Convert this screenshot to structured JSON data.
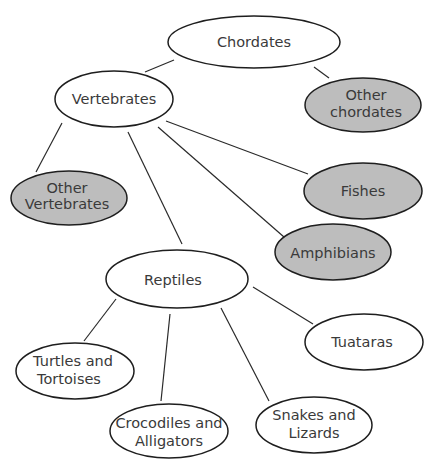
{
  "diagram": {
    "type": "concept-map",
    "colors": {
      "unshaded_fill": "#ffffff",
      "shaded_fill": "#bdbdbd",
      "stroke": "#1e1e1e"
    },
    "nodes": [
      {
        "id": "chordates",
        "lines": [
          "Chordates"
        ],
        "shaded": false
      },
      {
        "id": "vertebrates",
        "lines": [
          "Vertebrates"
        ],
        "shaded": false
      },
      {
        "id": "other_chordates",
        "lines": [
          "Other",
          "chordates"
        ],
        "shaded": true
      },
      {
        "id": "other_vertebrates",
        "lines": [
          "Other",
          "Vertebrates"
        ],
        "shaded": true
      },
      {
        "id": "fishes",
        "lines": [
          "Fishes"
        ],
        "shaded": true
      },
      {
        "id": "amphibians",
        "lines": [
          "Amphibians"
        ],
        "shaded": true
      },
      {
        "id": "reptiles",
        "lines": [
          "Reptiles"
        ],
        "shaded": false
      },
      {
        "id": "turtles",
        "lines": [
          "Turtles and",
          "Tortoises"
        ],
        "shaded": false
      },
      {
        "id": "crocodiles",
        "lines": [
          "Crocodiles and",
          "Alligators"
        ],
        "shaded": false
      },
      {
        "id": "snakes",
        "lines": [
          "Snakes and",
          "Lizards"
        ],
        "shaded": false
      },
      {
        "id": "tuataras",
        "lines": [
          "Tuataras"
        ],
        "shaded": false
      }
    ],
    "edges": [
      [
        "chordates",
        "vertebrates"
      ],
      [
        "chordates",
        "other_chordates"
      ],
      [
        "vertebrates",
        "other_vertebrates"
      ],
      [
        "vertebrates",
        "reptiles"
      ],
      [
        "vertebrates",
        "amphibians"
      ],
      [
        "vertebrates",
        "fishes"
      ],
      [
        "reptiles",
        "turtles"
      ],
      [
        "reptiles",
        "crocodiles"
      ],
      [
        "reptiles",
        "snakes"
      ],
      [
        "reptiles",
        "tuataras"
      ]
    ]
  }
}
